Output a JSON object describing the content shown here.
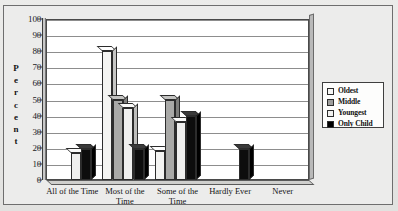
{
  "chart_data": {
    "type": "bar",
    "title": "",
    "xlabel": "",
    "ylabel": "Percent",
    "ylim": [
      0,
      100
    ],
    "yticks": [
      0,
      10,
      20,
      30,
      40,
      50,
      60,
      70,
      80,
      90,
      100
    ],
    "grid": true,
    "legend_position": "right",
    "categories": [
      "All of the Time",
      "Most of the Time",
      "Some of the Time",
      "Hardly Ever",
      "Never"
    ],
    "series": [
      {
        "name": "Oldest",
        "values": [
          0,
          80,
          18,
          0,
          0
        ]
      },
      {
        "name": "Middle",
        "values": [
          0,
          50,
          50,
          0,
          0
        ]
      },
      {
        "name": "Youngest",
        "values": [
          17,
          45,
          36,
          0,
          0
        ]
      },
      {
        "name": "Only Child",
        "values": [
          19,
          19,
          40,
          19,
          0
        ]
      }
    ]
  },
  "axis": {
    "y_label_letters": [
      "P",
      "e",
      "r",
      "c",
      "e",
      "n",
      "t"
    ],
    "y_ticks": [
      "100",
      "90",
      "80",
      "70",
      "60",
      "50",
      "40",
      "30",
      "20",
      "10",
      "0"
    ]
  },
  "legend": {
    "items": [
      {
        "label": "Oldest",
        "swatch": "legend-swatch-oldest",
        "color": "#f6f6f4"
      },
      {
        "label": "Middle",
        "swatch": "legend-swatch-middle",
        "color": "#9e9e9c"
      },
      {
        "label": "Youngest",
        "swatch": "legend-swatch-youngest",
        "color": "#f1f1ef"
      },
      {
        "label": "Only Child",
        "swatch": "legend-swatch-only-child",
        "color": "#000000"
      }
    ]
  },
  "categories": [
    {
      "line1": "All of the Time",
      "line2": ""
    },
    {
      "line1": "Most of the",
      "line2": "Time"
    },
    {
      "line1": "Some of the",
      "line2": "Time"
    },
    {
      "line1": "Hardly Ever",
      "line2": ""
    },
    {
      "line1": "Never",
      "line2": ""
    }
  ]
}
